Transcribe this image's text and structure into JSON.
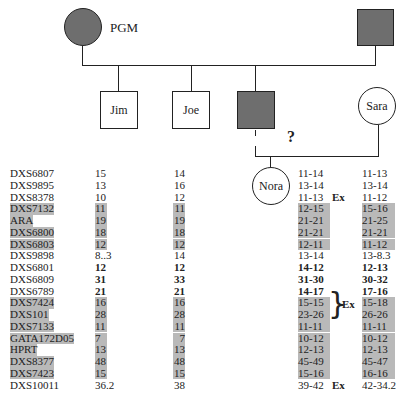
{
  "pedigree": {
    "pgm_label": "PGM",
    "individuals": {
      "pgm": {
        "label": "PGM",
        "sex": "female",
        "affected": true
      },
      "pgf": {
        "label": "",
        "sex": "male",
        "affected": true
      },
      "jim": {
        "label": "Jim",
        "sex": "male",
        "affected": false
      },
      "joe": {
        "label": "Joe",
        "sex": "male",
        "affected": false
      },
      "father": {
        "label": "",
        "sex": "male",
        "affected": true
      },
      "sara": {
        "label": "Sara",
        "sex": "female",
        "affected": false
      },
      "nora": {
        "label": "Nora",
        "sex": "female",
        "affected": false
      }
    },
    "question_mark": "?"
  },
  "markers": {
    "columns": [
      "Marker",
      "Jim",
      "Joe",
      "Nora",
      "Sara"
    ],
    "ex_label": "Ex",
    "rows": [
      {
        "marker": "DXS6807",
        "jim": "15",
        "joe": "14",
        "nora": "11-14",
        "sara": "11-13",
        "shaded": false,
        "bold": false,
        "nora_ex": false
      },
      {
        "marker": "DXS9895",
        "jim": "13",
        "joe": "16",
        "nora": "13-14",
        "sara": "13-14",
        "shaded": false,
        "bold": false,
        "nora_ex": false
      },
      {
        "marker": "DXS8378",
        "jim": "10",
        "joe": "12",
        "nora": "11-13",
        "sara": "11-12",
        "shaded": false,
        "bold": false,
        "nora_ex": true
      },
      {
        "marker": "DXS7132",
        "jim": "11",
        "joe": "11",
        "nora": "12-15",
        "sara": "15-16",
        "shaded": true,
        "bold": false,
        "nora_ex": false
      },
      {
        "marker": "ARA",
        "jim": "19",
        "joe": "19",
        "nora": "21-21",
        "sara": "21-25",
        "shaded": true,
        "bold": false,
        "nora_ex": false
      },
      {
        "marker": "DXS6800",
        "jim": "18",
        "joe": "18",
        "nora": "21-21",
        "sara": "21-21",
        "shaded": true,
        "bold": false,
        "nora_ex": false
      },
      {
        "marker": "DXS6803",
        "jim": "12",
        "joe": "12",
        "nora": "12-11",
        "sara": "11-12",
        "shaded": true,
        "bold": false,
        "nora_ex": false
      },
      {
        "marker": "DXS9898",
        "jim": "8..3",
        "joe": "14",
        "nora": "13-14",
        "sara": "13-8.3",
        "shaded": false,
        "bold": false,
        "nora_ex": false
      },
      {
        "marker": "DXS6801",
        "jim": "12",
        "joe": "12",
        "nora": "14-12",
        "sara": "12-13",
        "shaded": false,
        "bold": true,
        "nora_ex": false
      },
      {
        "marker": "DXS6809",
        "jim": "31",
        "joe": "33",
        "nora": "31-30",
        "sara": "30-32",
        "shaded": false,
        "bold": true,
        "nora_ex": false
      },
      {
        "marker": "DXS6789",
        "jim": "21",
        "joe": "21",
        "nora": "14-17",
        "sara": "17-16",
        "shaded": false,
        "bold": true,
        "nora_ex": false
      },
      {
        "marker": "DXS7424",
        "jim": "16",
        "joe": "16",
        "nora": "15-15",
        "sara": "15-18",
        "shaded": true,
        "bold": false,
        "nora_ex": false
      },
      {
        "marker": "DXS101",
        "jim": "28",
        "joe": "28",
        "nora": "23-26",
        "sara": "26-26",
        "shaded": true,
        "bold": false,
        "nora_ex": false
      },
      {
        "marker": "DXS7133",
        "jim": "11",
        "joe": "11",
        "nora": "11-11",
        "sara": "11-11",
        "shaded": true,
        "bold": false,
        "nora_ex": false
      },
      {
        "marker": "GATA172D05",
        "jim": "7",
        "joe": "7",
        "nora": "10-12",
        "sara": "10-12",
        "shaded": true,
        "bold": false,
        "nora_ex": false
      },
      {
        "marker": "HPRT",
        "jim": "13",
        "joe": "13",
        "nora": "12-13",
        "sara": "12-13",
        "shaded": true,
        "bold": false,
        "nora_ex": false
      },
      {
        "marker": "DXS8377",
        "jim": "48",
        "joe": "48",
        "nora": "45-49",
        "sara": "45-47",
        "shaded": true,
        "bold": false,
        "nora_ex": false
      },
      {
        "marker": "DXS7423",
        "jim": "15",
        "joe": "15",
        "nora": "15-16",
        "sara": "16-16",
        "shaded": true,
        "bold": false,
        "nora_ex": false
      },
      {
        "marker": "DXS10011",
        "jim": "36.2",
        "joe": "38",
        "nora": "39-42",
        "sara": "42-34.2",
        "shaded": false,
        "bold": false,
        "nora_ex": true
      }
    ]
  },
  "colors": {
    "affected": "#6e6e6e",
    "shade": "#b9b9b9",
    "line": "#222222"
  }
}
